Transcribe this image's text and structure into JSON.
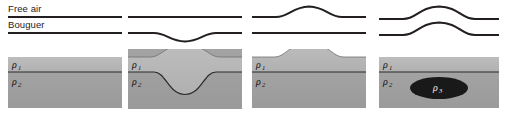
{
  "figure": {
    "width": 507,
    "height": 115,
    "background": "#ffffff",
    "curve_color": "#231f20",
    "curve_width": 2.1
  },
  "legend": {
    "free_air_label": "Free air",
    "bouguer_label": "Bouguer"
  },
  "layers": {
    "rho1_label": "ρ",
    "rho1_sub": "1",
    "rho2_label": "ρ",
    "rho2_sub": "2",
    "rho3_label": "ρ",
    "rho3_sub": "3",
    "rho1_color": "#b4b4b4",
    "rho2_color": "#9d9d9d",
    "rho3_color": "#191919",
    "interface_color": "#2b2b2b",
    "frame_color": "#cfcfcf"
  },
  "panels": [
    {
      "id": "panel-1",
      "name": "flat-crust-no-topography",
      "x": 8,
      "width": 114,
      "free_air": "flat",
      "bouguer": "flat",
      "topography": "flat",
      "root": "none",
      "body": "none",
      "labels": [
        "ρ₁",
        "ρ₂"
      ]
    },
    {
      "id": "panel-2",
      "name": "airy-compensated-topography-with-root",
      "x": 128,
      "width": 114,
      "free_air": "flat",
      "bouguer": "negative-anomaly",
      "topography": "bump",
      "root": "deep-root",
      "body": "none",
      "labels": [
        "ρ₁",
        "ρ₂"
      ]
    },
    {
      "id": "panel-3",
      "name": "uncompensated-topography-no-root",
      "x": 252,
      "width": 114,
      "free_air": "positive-anomaly",
      "bouguer": "flat",
      "topography": "bump",
      "root": "none",
      "body": "none",
      "labels": [
        "ρ₁",
        "ρ₂"
      ]
    },
    {
      "id": "panel-4",
      "name": "buried-dense-body",
      "x": 379,
      "width": 120,
      "free_air": "positive-anomaly",
      "bouguer": "positive-anomaly",
      "topography": "flat",
      "root": "none",
      "body": "dense-ellipse",
      "labels": [
        "ρ₁",
        "ρ₂",
        "ρ₃"
      ]
    }
  ],
  "geometry": {
    "free_air_baseline_y": 17,
    "bouguer_baseline_y": 33,
    "section_top_y": 49,
    "section_bottom_y": 108,
    "interface_y": 72
  }
}
